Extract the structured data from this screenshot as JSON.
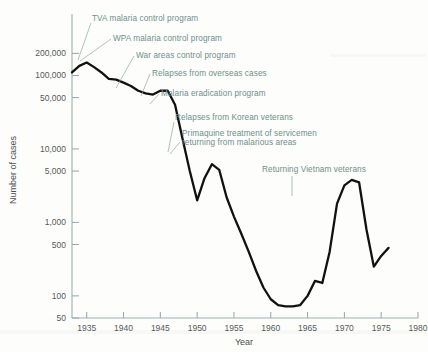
{
  "chart_data": {
    "type": "line",
    "title": "",
    "xlabel": "Year",
    "ylabel": "Number of cases",
    "yscale": "log",
    "xlim": [
      1933,
      1980
    ],
    "ylim": [
      50,
      260000
    ],
    "grid": false,
    "legend_position": "none",
    "x_ticks": [
      1935,
      1940,
      1945,
      1950,
      1955,
      1960,
      1965,
      1970,
      1975,
      1980
    ],
    "x_tick_labels": [
      "1935",
      "1940",
      "1945",
      "1950",
      "1955",
      "1960",
      "1965",
      "1970",
      "1975",
      "1980"
    ],
    "y_ticks": [
      50,
      100,
      500,
      1000,
      5000,
      10000,
      50000,
      100000,
      200000
    ],
    "y_tick_labels": [
      "50",
      "100",
      "500",
      "1,000",
      "5,000",
      "10,000",
      "50,000",
      "100,000",
      "200,000"
    ],
    "series": [
      {
        "name": "Malaria cases in the United States",
        "color": "#111111",
        "x": [
          1933,
          1934,
          1935,
          1936,
          1937,
          1938,
          1939,
          1940,
          1941,
          1942,
          1943,
          1944,
          1945,
          1946,
          1947,
          1948,
          1949,
          1950,
          1951,
          1952,
          1953,
          1954,
          1955,
          1956,
          1957,
          1958,
          1959,
          1960,
          1961,
          1962,
          1963,
          1964,
          1965,
          1966,
          1967,
          1968,
          1969,
          1970,
          1971,
          1972,
          1973,
          1974,
          1975,
          1976
        ],
        "values": [
          110000,
          135000,
          150000,
          130000,
          110000,
          90000,
          88000,
          80000,
          72000,
          62000,
          57000,
          55000,
          62000,
          62000,
          40000,
          14000,
          5000,
          2000,
          4000,
          6200,
          5200,
          2200,
          1200,
          700,
          400,
          220,
          130,
          90,
          75,
          72,
          72,
          75,
          100,
          160,
          150,
          400,
          1800,
          3200,
          3800,
          3500,
          800,
          250,
          350,
          450
        ]
      }
    ],
    "annotations": [
      {
        "id": "tva",
        "text": "TVA malaria control program",
        "text_x": 92,
        "text_y": 21,
        "leader": "M91,23 L78,60"
      },
      {
        "id": "wpa",
        "text": "WPA malaria control program",
        "text_x": 113,
        "text_y": 41,
        "leader": "M111,39 L80,61"
      },
      {
        "id": "war-areas",
        "text": "War areas control program",
        "text_x": 136,
        "text_y": 58,
        "leader": "M134,56 L116,88"
      },
      {
        "id": "relapses-overseas",
        "text": "Relapses from overseas cases",
        "text_x": 152,
        "text_y": 76,
        "leader": "M150,74 L141,96"
      },
      {
        "id": "eradication",
        "text": "Malaria eradication program",
        "text_x": 161,
        "text_y": 96,
        "leader": "M159,94 L150,104"
      },
      {
        "id": "relapses-korean",
        "text": "Relapses from Korean veterans",
        "text_x": 175,
        "text_y": 120,
        "leader": "M174,122 L168,152"
      },
      {
        "id": "primaquine",
        "text": "Primaquine treatment of servicemen",
        "text_x": 182,
        "text_y": 136,
        "leader": "M180,142 L170,154"
      },
      {
        "id": "primaquine-line2",
        "text": "returning from malarious areas",
        "text_x": 182,
        "text_y": 145,
        "leader": ""
      },
      {
        "id": "vietnam",
        "text": "Returning Vietnam veterans",
        "text_x": 262,
        "text_y": 172,
        "leader": "M292,176 L292,196"
      }
    ]
  }
}
